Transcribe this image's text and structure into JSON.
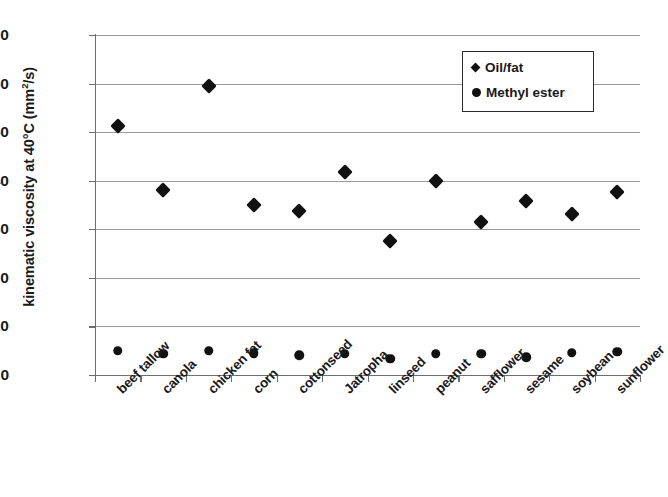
{
  "chart_data": {
    "type": "scatter",
    "title": "",
    "xlabel": "",
    "ylabel": "kinematic viscosity at 40°C (mm²/s)",
    "ylabel_main": "kinematic viscosity at 40",
    "ylabel_deg": "°C (mm",
    "ylabel_sup": "2",
    "ylabel_tail": "/s)",
    "ylim": [
      0,
      70
    ],
    "ytick_step": 10,
    "yticks": [
      70,
      60,
      50,
      40,
      30,
      20,
      10,
      0
    ],
    "ytick_labels": [
      "70",
      "60",
      "50",
      "40",
      "30",
      "20",
      "10",
      "0"
    ],
    "grid": true,
    "grid_axis": "y",
    "legend_position": "top-right",
    "marker_color": "#111111",
    "grid_color": "#9b9b9b",
    "axis_color": "#6e6e6e",
    "categories": [
      "beef tallow",
      "canola",
      "chicken fat",
      "corn",
      "cottonseed",
      "Jatropha",
      "linseed",
      "peanut",
      "safflower",
      "sesame",
      "soybean",
      "sunflower"
    ],
    "series": [
      {
        "name": "Oil/fat",
        "marker": "diamond",
        "values": [
          51.3,
          38.0,
          59.4,
          35.0,
          33.7,
          41.7,
          27.5,
          40.0,
          31.6,
          35.9,
          33.2,
          37.6
        ]
      },
      {
        "name": "Methyl ester",
        "marker": "circle",
        "values": [
          5.0,
          4.4,
          5.0,
          4.5,
          4.1,
          4.4,
          3.3,
          4.4,
          4.4,
          3.7,
          4.6,
          4.8
        ]
      }
    ]
  },
  "legend": {
    "items": [
      {
        "label": "Oil/fat",
        "marker": "diamond"
      },
      {
        "label": "Methyl ester",
        "marker": "circle"
      }
    ]
  }
}
